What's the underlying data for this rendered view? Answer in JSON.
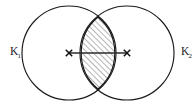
{
  "figure": {
    "type": "two-overlapping-circles-venn-lens",
    "background_color": "#ffffff",
    "stroke_color": "#1a1a1a",
    "hatch_color": "#3a3a3a",
    "canvas": {
      "width": 196,
      "height": 106
    },
    "labels": {
      "left_circle": {
        "base": "K",
        "subscript": "1",
        "x": 10,
        "y": 55
      },
      "right_circle": {
        "base": "K",
        "subscript": "2",
        "x": 181,
        "y": 55
      }
    },
    "circles": [
      {
        "name": "left-circle",
        "cx": 69,
        "cy": 53,
        "r": 47
      },
      {
        "name": "right-circle",
        "cx": 127,
        "cy": 53,
        "r": 47
      }
    ],
    "intersection": {
      "name": "lens-region",
      "hatched": true,
      "hatch_angle_deg": 45,
      "hatch_spacing_px": 4,
      "top_point": {
        "x": 98,
        "y": 17
      },
      "bottom_point": {
        "x": 98,
        "y": 89
      }
    },
    "center_segment": {
      "name": "center-to-center-segment",
      "x1": 69,
      "y1": 53,
      "x2": 127,
      "y2": 53
    },
    "center_markers": [
      {
        "name": "left-center-marker",
        "glyph": "x",
        "x": 69,
        "y": 53
      },
      {
        "name": "right-center-marker",
        "glyph": "x",
        "x": 127,
        "y": 53
      }
    ]
  }
}
